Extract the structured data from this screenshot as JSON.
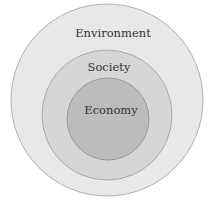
{
  "diagram": {
    "type": "nested-circles",
    "circles": [
      {
        "label": "Environment",
        "fill": "#e8e8e8",
        "stroke": "#b0b0b0"
      },
      {
        "label": "Society",
        "fill": "#d6d6d6",
        "stroke": "#a8a8a8"
      },
      {
        "label": "Economy",
        "fill": "#bcbcbc",
        "stroke": "#9a9a9a"
      }
    ]
  }
}
